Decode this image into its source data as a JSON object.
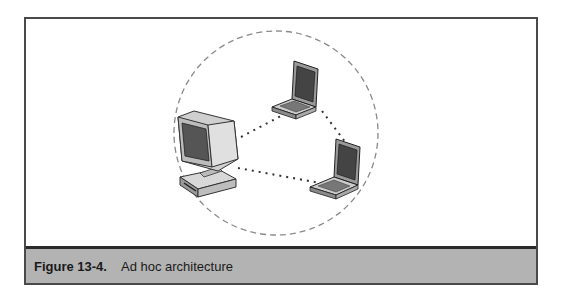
{
  "figure": {
    "label": "Figure 13-4.",
    "title": "Ad hoc architecture",
    "nodes": [
      {
        "type": "desktop-computer",
        "icon": "desktop-computer-icon"
      },
      {
        "type": "laptop",
        "icon": "laptop-icon",
        "position": "top"
      },
      {
        "type": "laptop",
        "icon": "laptop-icon",
        "position": "bottom-right"
      }
    ],
    "links": [
      {
        "from": "desktop",
        "to": "laptop-top",
        "style": "dotted"
      },
      {
        "from": "desktop",
        "to": "laptop-bottom-right",
        "style": "dotted"
      },
      {
        "from": "laptop-top",
        "to": "laptop-bottom-right",
        "style": "dotted"
      }
    ],
    "boundary": {
      "shape": "circle",
      "style": "dashed"
    },
    "colors": {
      "caption_band": "#b3b3b3",
      "border": "#4a4a4a"
    }
  }
}
